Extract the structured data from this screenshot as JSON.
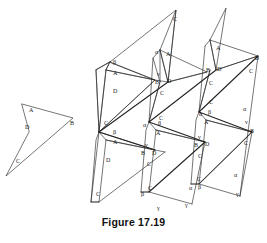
{
  "figure": {
    "caption": "Figure 17.19",
    "background_color": "#ffffff",
    "stroke_color": "#2b2b2b",
    "label_color": "#1a1a1a"
  },
  "vertex_labels": {
    "a": "A",
    "b": "B",
    "c": "C",
    "d": "D"
  },
  "angle_labels": {
    "alpha": "α",
    "beta": "β",
    "gamma": "γ",
    "nu": "ν"
  },
  "shapes": {
    "sample_quadrilateral": {
      "name": "dart-quadrilateral-ABCD",
      "labels": [
        "A",
        "B",
        "C",
        "D"
      ]
    },
    "tessellation": {
      "name": "quadrilateral-tessellation",
      "tile_count": 9,
      "labels": [
        "A",
        "B",
        "C",
        "D",
        "α",
        "β",
        "γ",
        "ν"
      ]
    }
  },
  "sample_quad_labels": [
    {
      "text": "A",
      "x": 29,
      "y": 112
    },
    {
      "text": "B",
      "x": 70,
      "y": 125
    },
    {
      "text": "C",
      "x": 16,
      "y": 163
    },
    {
      "text": "D",
      "x": 25,
      "y": 129
    }
  ],
  "tess_vertex_labels": [
    {
      "text": "β",
      "x": 113,
      "y": 64
    },
    {
      "text": "A",
      "x": 113,
      "y": 75
    },
    {
      "text": "D",
      "x": 113,
      "y": 93
    },
    {
      "text": "C",
      "x": 104,
      "y": 125
    },
    {
      "text": "β",
      "x": 113,
      "y": 134
    },
    {
      "text": "A",
      "x": 113,
      "y": 144
    },
    {
      "text": "D",
      "x": 106,
      "y": 162
    },
    {
      "text": "C",
      "x": 96,
      "y": 196
    },
    {
      "text": "C",
      "x": 173,
      "y": 21
    },
    {
      "text": "α",
      "x": 155,
      "y": 54
    },
    {
      "text": "A",
      "x": 166,
      "y": 56
    },
    {
      "text": "ν",
      "x": 157,
      "y": 76
    },
    {
      "text": "B",
      "x": 155,
      "y": 84
    },
    {
      "text": "D",
      "x": 167,
      "y": 83
    },
    {
      "text": "C",
      "x": 160,
      "y": 95
    },
    {
      "text": "C",
      "x": 159,
      "y": 120
    },
    {
      "text": "α",
      "x": 143,
      "y": 127
    },
    {
      "text": "β",
      "x": 158,
      "y": 125
    },
    {
      "text": "A",
      "x": 156,
      "y": 135
    },
    {
      "text": "ν",
      "x": 145,
      "y": 147
    },
    {
      "text": "B",
      "x": 141,
      "y": 155
    },
    {
      "text": "D",
      "x": 152,
      "y": 155
    },
    {
      "text": "C",
      "x": 147,
      "y": 166
    },
    {
      "text": "C",
      "x": 148,
      "y": 190
    },
    {
      "text": "β",
      "x": 141,
      "y": 196
    },
    {
      "text": "γ",
      "x": 185,
      "y": 207
    },
    {
      "text": "A",
      "x": 216,
      "y": 50
    },
    {
      "text": "B",
      "x": 206,
      "y": 72
    },
    {
      "text": "D",
      "x": 217,
      "y": 71
    },
    {
      "text": "C",
      "x": 209,
      "y": 85
    },
    {
      "text": "C",
      "x": 209,
      "y": 104
    },
    {
      "text": "α",
      "x": 199,
      "y": 116
    },
    {
      "text": "β",
      "x": 208,
      "y": 114
    },
    {
      "text": "A",
      "x": 204,
      "y": 124
    },
    {
      "text": "ν",
      "x": 198,
      "y": 139
    },
    {
      "text": "B",
      "x": 194,
      "y": 147
    },
    {
      "text": "D",
      "x": 205,
      "y": 146
    },
    {
      "text": "C",
      "x": 198,
      "y": 158
    },
    {
      "text": "C",
      "x": 197,
      "y": 181
    },
    {
      "text": "α",
      "x": 189,
      "y": 190
    },
    {
      "text": "β",
      "x": 198,
      "y": 189
    },
    {
      "text": "B",
      "x": 255,
      "y": 60
    },
    {
      "text": "C",
      "x": 249,
      "y": 73
    },
    {
      "text": "α",
      "x": 243,
      "y": 111
    },
    {
      "text": "ν",
      "x": 245,
      "y": 124
    },
    {
      "text": "B",
      "x": 250,
      "y": 133
    },
    {
      "text": "C",
      "x": 244,
      "y": 145
    },
    {
      "text": "α",
      "x": 234,
      "y": 177
    },
    {
      "text": "γ",
      "x": 236,
      "y": 196
    },
    {
      "text": "γ",
      "x": 157,
      "y": 210
    }
  ]
}
